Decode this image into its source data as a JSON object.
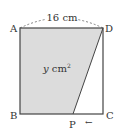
{
  "diagram": {
    "type": "geometry",
    "shape": "square ABCD",
    "vertices": {
      "A": "A",
      "B": "B",
      "C": "C",
      "D": "D",
      "P": "P"
    },
    "side_label": "16 cm",
    "area_label": "y cm",
    "area_sup": "2",
    "arrow": "←",
    "colors": {
      "shaded": "#dcdcdc",
      "stroke": "#444444"
    }
  }
}
